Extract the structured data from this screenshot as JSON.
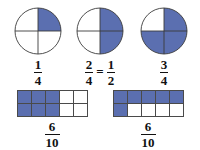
{
  "figure": {
    "background_color": "#ffffff",
    "shade_color": "#5b6fb0",
    "line_color": "#4a4a4a",
    "text_color": "#111111"
  },
  "circles": [
    {
      "name": "circle-one-quarter",
      "total_parts": 4,
      "shaded_parts": 1,
      "shaded_quadrants": [
        "top-right"
      ],
      "label": {
        "numerator": "1",
        "denominator": "4",
        "has_equivalent": false,
        "equals_sign": "",
        "equiv_numerator": "",
        "equiv_denominator": ""
      }
    },
    {
      "name": "circle-two-quarters",
      "total_parts": 4,
      "shaded_parts": 2,
      "shaded_quadrants": [
        "top-right",
        "bottom-right"
      ],
      "label": {
        "numerator": "2",
        "denominator": "4",
        "has_equivalent": true,
        "equals_sign": "=",
        "equiv_numerator": "1",
        "equiv_denominator": "2"
      }
    },
    {
      "name": "circle-three-quarters",
      "total_parts": 4,
      "shaded_parts": 3,
      "shaded_quadrants": [
        "top-right",
        "bottom-right",
        "bottom-left"
      ],
      "label": {
        "numerator": "3",
        "denominator": "4",
        "has_equivalent": false,
        "equals_sign": "",
        "equiv_numerator": "",
        "equiv_denominator": ""
      }
    }
  ],
  "rectangles": [
    {
      "name": "grid-six-tenths-columns",
      "columns": 5,
      "rows": 2,
      "total_parts": 10,
      "shaded_parts": 6,
      "shaded_cells": [
        1,
        1,
        1,
        0,
        0,
        1,
        1,
        1,
        0,
        0
      ],
      "label": {
        "numerator": "6",
        "denominator": "10"
      }
    },
    {
      "name": "grid-six-tenths-row",
      "columns": 5,
      "rows": 2,
      "total_parts": 10,
      "shaded_parts": 6,
      "shaded_cells": [
        1,
        1,
        1,
        1,
        1,
        1,
        0,
        0,
        0,
        0
      ],
      "label": {
        "numerator": "6",
        "denominator": "10"
      }
    }
  ]
}
